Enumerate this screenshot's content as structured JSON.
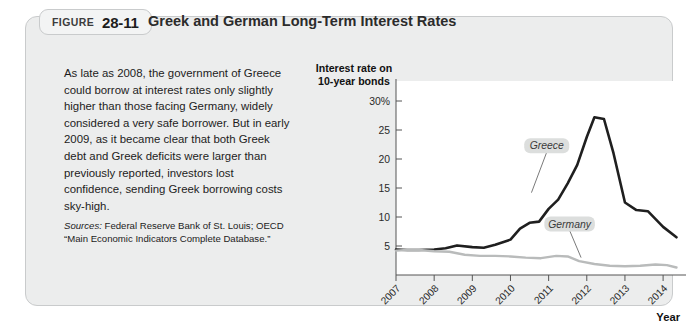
{
  "figure": {
    "tab_word": "FIGURE",
    "number": "28-11",
    "title": "Greek and German Long-Term Interest Rates"
  },
  "caption": {
    "body": "As late as 2008, the government of Greece could borrow at interest rates only slightly higher than those facing Germany, widely considered a very safe borrower. But in early 2009, as it became clear that both Greek debt and Greek deficits were larger than previously reported, investors lost confidence, sending Greek borrowing costs sky-high.",
    "sources_lead": "Sources:",
    "sources_text": " Federal Reserve Bank of St. Louis; OECD “Main Economic Indicators Complete Database.”"
  },
  "chart_data": {
    "type": "line",
    "title": "Greek and German Long-Term Interest Rates",
    "ylabel_line1": "Interest rate on",
    "ylabel_line2": "10-year bonds",
    "xlabel": "Year",
    "ylim": [
      0,
      30
    ],
    "yticks": [
      5,
      10,
      15,
      20,
      25,
      30
    ],
    "ytick_labels": [
      "5",
      "10",
      "15",
      "20",
      "25",
      "30%"
    ],
    "xlim": [
      2007,
      2014.6
    ],
    "xticks": [
      2007,
      2008,
      2009,
      2010,
      2011,
      2012,
      2013,
      2014
    ],
    "xtick_labels": [
      "2007",
      "2008",
      "2009",
      "2010",
      "2011",
      "2012",
      "2013",
      "2014"
    ],
    "grid": false,
    "legend_position": "inline-callout",
    "series": [
      {
        "name": "Greece",
        "color": "#1f1f1f",
        "x": [
          2007.0,
          2007.3,
          2007.6,
          2008.0,
          2008.3,
          2008.6,
          2009.0,
          2009.3,
          2009.6,
          2010.0,
          2010.25,
          2010.5,
          2010.75,
          2011.0,
          2011.25,
          2011.5,
          2011.75,
          2012.0,
          2012.2,
          2012.45,
          2012.7,
          2013.0,
          2013.3,
          2013.6,
          2014.0,
          2014.35
        ],
        "values": [
          4.4,
          4.3,
          4.3,
          4.4,
          4.6,
          5.1,
          4.8,
          4.7,
          5.2,
          6.1,
          8.0,
          9.0,
          9.2,
          11.4,
          13.0,
          15.8,
          19.0,
          23.8,
          27.2,
          26.9,
          21.0,
          12.5,
          11.2,
          11.0,
          8.3,
          6.5
        ]
      },
      {
        "name": "Germany",
        "color": "#b9bbbb",
        "x": [
          2007.0,
          2007.3,
          2007.6,
          2008.0,
          2008.4,
          2008.8,
          2009.2,
          2009.6,
          2010.0,
          2010.4,
          2010.8,
          2011.2,
          2011.5,
          2011.8,
          2012.2,
          2012.6,
          2013.0,
          2013.4,
          2013.8,
          2014.1,
          2014.35
        ],
        "values": [
          4.2,
          4.3,
          4.3,
          4.1,
          4.0,
          3.5,
          3.3,
          3.3,
          3.2,
          3.0,
          2.9,
          3.3,
          3.2,
          2.4,
          1.9,
          1.6,
          1.5,
          1.6,
          1.8,
          1.7,
          1.3
        ]
      }
    ],
    "annotations": [
      {
        "label": "Greece",
        "x": 2011.0,
        "y": 22.5
      },
      {
        "label": "Germany",
        "x": 2011.55,
        "y": 9.0
      }
    ]
  },
  "colors": {
    "card_background": "#eceded",
    "card_border": "#c9cbcc",
    "plot_background": "#ffffff",
    "greece_line": "#1f1f1f",
    "germany_line": "#b9bbbb",
    "tag_background": "#dcdedd"
  }
}
